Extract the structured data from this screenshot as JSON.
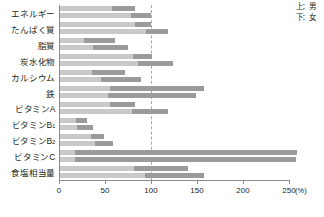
{
  "legend": {
    "upper": "上：男",
    "lower": "下：女"
  },
  "axis": {
    "unit": "(%)",
    "ticks": [
      "0",
      "50",
      "100",
      "150",
      "200",
      "250"
    ]
  },
  "chart_data": {
    "type": "bar",
    "orientation": "horizontal",
    "title": "",
    "xlabel": "(%)",
    "ylabel": "",
    "xlim": [
      0,
      250
    ],
    "grid": true,
    "gridlines": [
      100
    ],
    "legend_position": "top-right",
    "legend_entries": [
      "上：男",
      "下：女"
    ],
    "stacked_segments": [
      "light",
      "dark"
    ],
    "segment_colors": [
      "#c9c9c9",
      "#9b9b9b"
    ],
    "categories": [
      "エネルギー",
      "たんぱく質",
      "脂質",
      "炭水化物",
      "カルシウム",
      "鉄",
      "ビタミンA",
      "ビタミンB1",
      "ビタミンB2",
      "ビタミンC",
      "食塩相当量"
    ],
    "series": [
      {
        "name": "上：男",
        "values": [
          81,
          99,
          60,
          100,
          71,
          157,
          82,
          29,
          48,
          258,
          139
        ],
        "segment_break": [
          57,
          81,
          26,
          79,
          35,
          54,
          54,
          17,
          34,
          16,
          80
        ]
      },
      {
        "name": "下：女",
        "values": [
          99,
          117,
          74,
          123,
          88,
          148,
          117,
          36,
          58,
          256,
          157
        ],
        "segment_break": [
          77,
          93,
          36,
          85,
          45,
          52,
          78,
          18,
          38,
          16,
          92
        ]
      }
    ]
  }
}
